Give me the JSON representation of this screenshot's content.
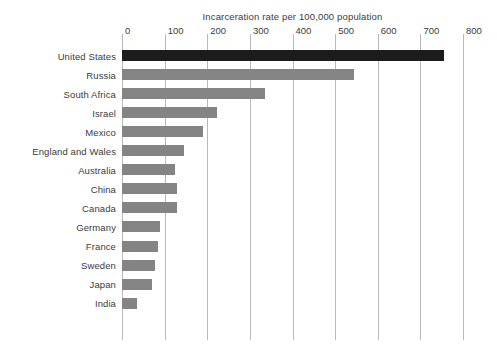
{
  "chart_data": {
    "type": "bar",
    "orientation": "horizontal",
    "title": "Incarceration rate per 100,000 population",
    "xlabel": "",
    "ylabel": "",
    "xlim": [
      0,
      800
    ],
    "xticks": [
      0,
      100,
      200,
      300,
      400,
      500,
      600,
      700,
      800
    ],
    "xtick_labels": [
      "0",
      "100",
      "200",
      "300",
      "400",
      "500",
      "600",
      "700",
      "800"
    ],
    "grid": "vertical",
    "legend": "none",
    "categories": [
      "United States",
      "Russia",
      "South Africa",
      "Israel",
      "Mexico",
      "England and Wales",
      "Australia",
      "China",
      "Canada",
      "Germany",
      "France",
      "Sweden",
      "Japan",
      "India"
    ],
    "values": [
      755,
      545,
      335,
      223,
      190,
      145,
      125,
      130,
      130,
      90,
      85,
      78,
      70,
      35
    ],
    "bar_colors": [
      "#1c1c1c",
      "#848484",
      "#848484",
      "#848484",
      "#848484",
      "#848484",
      "#848484",
      "#848484",
      "#848484",
      "#848484",
      "#848484",
      "#848484",
      "#848484",
      "#848484"
    ],
    "highlight_category": "United States",
    "colors": {
      "bar_default": "#848484",
      "bar_highlight": "#1c1c1c",
      "gridline": "#b9b9b9",
      "text": "#3c3c3c",
      "background": "#ffffff"
    }
  }
}
